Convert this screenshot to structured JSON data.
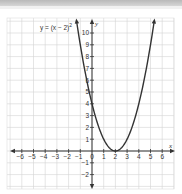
{
  "chart_data": {
    "type": "line",
    "title": "",
    "equation_label": "y = (x − 2)²",
    "xlabel": "x",
    "ylabel": "y",
    "xlim": [
      -6.5,
      7
    ],
    "ylim": [
      -3,
      11
    ],
    "x_ticks": [
      -6,
      -5,
      -4,
      -3,
      -2,
      -1,
      0,
      1,
      2,
      3,
      4,
      5,
      6
    ],
    "y_ticks": [
      -2,
      -1,
      1,
      2,
      3,
      4,
      5,
      6,
      7,
      8,
      9,
      10
    ],
    "grid": true,
    "series": [
      {
        "name": "y = (x − 2)²",
        "function": "(x-2)^2",
        "vertex": [
          2,
          0
        ],
        "x": [
          -1.3,
          -1,
          0,
          1,
          2,
          3,
          4,
          5,
          5.3
        ],
        "y": [
          10.89,
          9,
          4,
          1,
          0,
          1,
          4,
          9,
          10.89
        ],
        "color": "#333333"
      }
    ],
    "axis_color": "#333333",
    "grid_color": "#d4d4d4"
  },
  "labels": {
    "x_axis": "x",
    "y_axis": "y",
    "equation": "y = (x − 2)",
    "equation_exp": "2",
    "origin": "0"
  }
}
